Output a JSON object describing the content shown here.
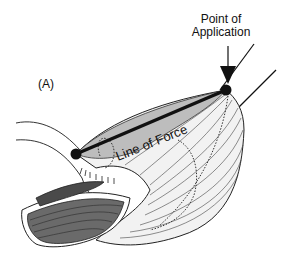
{
  "figure": {
    "panel_label": "(A)",
    "annotations": {
      "point_of_application_line1": "Point of",
      "point_of_application_line2": "Application",
      "line_of_force": "Line of Force"
    },
    "colors": {
      "muscle_dark": "#555555",
      "muscle_mid": "#9a9a9a",
      "muscle_light": "#d6d6d6",
      "muscle_pale": "#efefef",
      "force_line": "#111111"
    }
  }
}
